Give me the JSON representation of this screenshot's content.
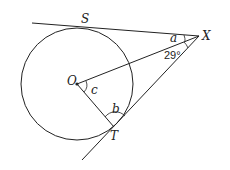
{
  "diagram": {
    "points": {
      "S": {
        "label": "S"
      },
      "X": {
        "label": "X"
      },
      "O": {
        "label": "O"
      },
      "T": {
        "label": "T"
      }
    },
    "angles": {
      "a": {
        "label": "a"
      },
      "given": {
        "label": "29°"
      },
      "b": {
        "label": "b"
      },
      "c": {
        "label": "c"
      }
    },
    "colors": {
      "stroke": "#222222",
      "background": "#ffffff"
    }
  }
}
